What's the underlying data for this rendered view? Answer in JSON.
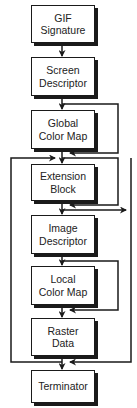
{
  "diagram": {
    "boxes": [
      {
        "id": "gif-signature",
        "lines": [
          "GIF",
          "Signature"
        ]
      },
      {
        "id": "screen-descriptor",
        "lines": [
          "Screen",
          "Descriptor"
        ]
      },
      {
        "id": "global-color-map",
        "lines": [
          "Global",
          "Color Map"
        ]
      },
      {
        "id": "extension-block",
        "lines": [
          "Extension",
          "Block"
        ]
      },
      {
        "id": "image-descriptor",
        "lines": [
          "Image",
          "Descriptor"
        ]
      },
      {
        "id": "local-color-map",
        "lines": [
          "Local",
          "Color Map"
        ]
      },
      {
        "id": "raster-data",
        "lines": [
          "Raster",
          "Data"
        ]
      },
      {
        "id": "terminator",
        "lines": [
          "Terminator"
        ]
      }
    ],
    "edges": [
      {
        "from": "gif-signature",
        "to": "screen-descriptor",
        "type": "sequence"
      },
      {
        "from": "screen-descriptor",
        "to": "global-color-map",
        "type": "sequence"
      },
      {
        "from": "screen-descriptor",
        "to": "extension-block",
        "type": "bypass-optional",
        "around": "global-color-map"
      },
      {
        "from": "global-color-map",
        "to": "extension-block",
        "type": "sequence"
      },
      {
        "from": "extension-block",
        "to": "image-descriptor",
        "type": "sequence"
      },
      {
        "from": "before-extension-block",
        "to": "image-descriptor",
        "type": "bypass-optional",
        "around": "extension-block"
      },
      {
        "from": "image-descriptor",
        "to": "local-color-map",
        "type": "sequence"
      },
      {
        "from": "image-descriptor",
        "to": "raster-data",
        "type": "bypass-optional",
        "around": "local-color-map"
      },
      {
        "from": "local-color-map",
        "to": "raster-data",
        "type": "sequence"
      },
      {
        "from": "raster-data",
        "to": "terminator",
        "type": "sequence"
      },
      {
        "from": "raster-data",
        "to": "extension-block",
        "type": "repeat-loop",
        "side": "left"
      },
      {
        "from": "extension-block",
        "to": "terminator",
        "type": "exit-loop",
        "side": "right"
      }
    ],
    "colors": {
      "stroke": "#1a1a1a",
      "fill": "#ffffff",
      "text": "#222222"
    }
  }
}
